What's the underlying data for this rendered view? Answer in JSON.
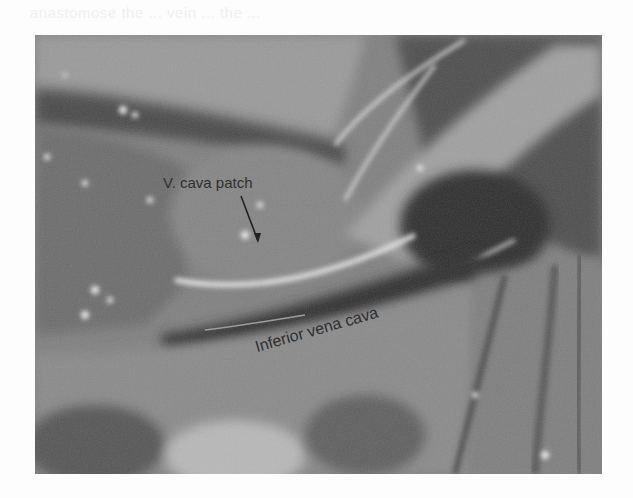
{
  "page": {
    "bleed_through_text": "anastomose the ... vein ... the ..."
  },
  "figure": {
    "type": "grayscale intraoperative photograph",
    "labels": {
      "patch": "V. cava patch",
      "ivc": "Inferior vena cava"
    },
    "colors": {
      "page_background": "#fdfdfd",
      "label_text": "#2f2f2f",
      "tissue_mid": "#7d7d7d",
      "tissue_dark": "#3a3a3a",
      "tissue_light": "#bdbdbd",
      "highlight": "#f0f0f0"
    }
  }
}
